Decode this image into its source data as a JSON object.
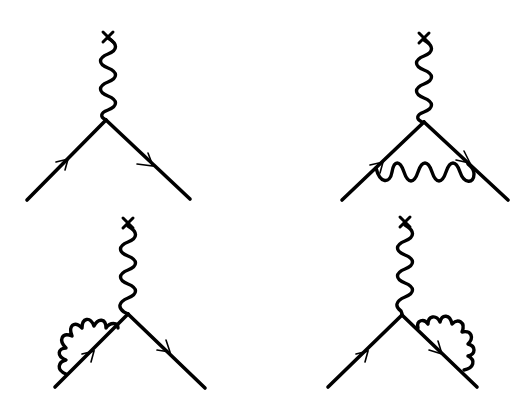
{
  "figure": {
    "line_color": "#000000",
    "background": "#ffffff",
    "diagrams": [
      {
        "id": "tree-vertex",
        "position": "top-left",
        "external_source": {
          "x": 108,
          "y": 37
        },
        "vertex": {
          "x": 106,
          "y": 120
        },
        "incoming_fermion": {
          "from": [
            27,
            200
          ],
          "to": [
            106,
            120
          ]
        },
        "outgoing_fermion": {
          "from": [
            106,
            120
          ],
          "to": [
            190,
            199
          ]
        },
        "loop": "none"
      },
      {
        "id": "vertex-correction",
        "position": "top-right",
        "external_source": {
          "x": 424,
          "y": 37
        },
        "vertex": {
          "x": 424,
          "y": 122
        },
        "incoming_fermion": {
          "from": [
            342,
            200
          ],
          "to": [
            424,
            122
          ]
        },
        "outgoing_fermion": {
          "from": [
            424,
            122
          ],
          "to": [
            508,
            200
          ]
        },
        "loop": "photon-exchange-between-legs"
      },
      {
        "id": "incoming-self-energy",
        "position": "bottom-left",
        "external_source": {
          "x": 128,
          "y": 222
        },
        "vertex": {
          "x": 128,
          "y": 314
        },
        "incoming_fermion": {
          "from": [
            55,
            387
          ],
          "to": [
            128,
            314
          ]
        },
        "outgoing_fermion": {
          "from": [
            128,
            314
          ],
          "to": [
            205,
            388
          ]
        },
        "loop": "self-energy-on-incoming-leg"
      },
      {
        "id": "outgoing-self-energy",
        "position": "bottom-right",
        "external_source": {
          "x": 405,
          "y": 222
        },
        "vertex": {
          "x": 402,
          "y": 315
        },
        "incoming_fermion": {
          "from": [
            328,
            387
          ],
          "to": [
            402,
            315
          ]
        },
        "outgoing_fermion": {
          "from": [
            402,
            315
          ],
          "to": [
            477,
            387
          ]
        },
        "loop": "self-energy-on-outgoing-leg"
      }
    ]
  }
}
